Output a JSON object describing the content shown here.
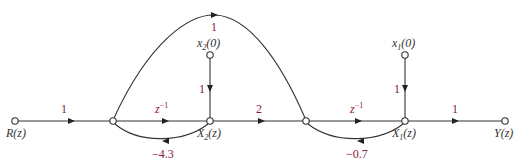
{
  "diagram": {
    "type": "signal-flow-graph",
    "colors": {
      "edge": "#333333",
      "gain_label": "#8b2040",
      "node_label": "#333333"
    },
    "nodes": [
      {
        "id": "R",
        "label": "R(z)"
      },
      {
        "id": "A",
        "label": ""
      },
      {
        "id": "X2",
        "label_main": "X",
        "label_sub": "2",
        "label_tail": "(z)"
      },
      {
        "id": "B",
        "label": ""
      },
      {
        "id": "X1",
        "label_main": "X",
        "label_sub": "1",
        "label_tail": "(z)"
      },
      {
        "id": "Y",
        "label": "Y(z)"
      },
      {
        "id": "x2_0",
        "label_main": "x",
        "label_sub": "2",
        "label_tail": "(0)"
      },
      {
        "id": "x1_0",
        "label_main": "x",
        "label_sub": "1",
        "label_tail": "(0)"
      }
    ],
    "edges": [
      {
        "from": "R",
        "to": "A",
        "gain": "1"
      },
      {
        "from": "A",
        "to": "X2",
        "gain_base": "z",
        "gain_sup": "−1"
      },
      {
        "from": "X2",
        "to": "B",
        "gain": "2"
      },
      {
        "from": "B",
        "to": "X1",
        "gain_base": "z",
        "gain_sup": "−1"
      },
      {
        "from": "X1",
        "to": "Y",
        "gain": "1"
      },
      {
        "from": "A",
        "to": "B",
        "gain": "1"
      },
      {
        "from": "X2",
        "to": "A",
        "gain": "−4.3"
      },
      {
        "from": "X1",
        "to": "B",
        "gain": "−0.7"
      },
      {
        "from": "x2_0",
        "to": "X2",
        "gain": "1"
      },
      {
        "from": "x1_0",
        "to": "X1",
        "gain": "1"
      }
    ]
  }
}
